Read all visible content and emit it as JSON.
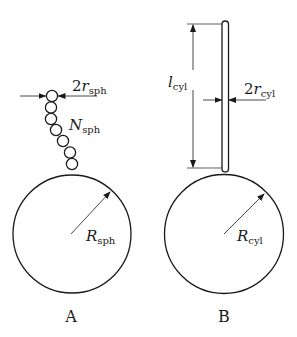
{
  "panels": [
    {
      "id": "A",
      "caption": "A",
      "model": "sphere-chain",
      "large_sphere": {
        "label_main": "R",
        "label_sub": "sph"
      },
      "chain": {
        "label_main": "N",
        "label_sub": "sph",
        "bead_count": 7
      },
      "bead_diameter": {
        "label_prefix": "2",
        "label_main": "r",
        "label_sub": "sph"
      }
    },
    {
      "id": "B",
      "caption": "B",
      "model": "cylinder",
      "large_sphere": {
        "label_main": "R",
        "label_sub": "cyl"
      },
      "length": {
        "label_main": "l",
        "label_sub": "cyl"
      },
      "diameter": {
        "label_prefix": "2",
        "label_main": "r",
        "label_sub": "cyl"
      }
    }
  ],
  "colors": {
    "stroke": "#1a1a1a",
    "background": "#ffffff"
  }
}
